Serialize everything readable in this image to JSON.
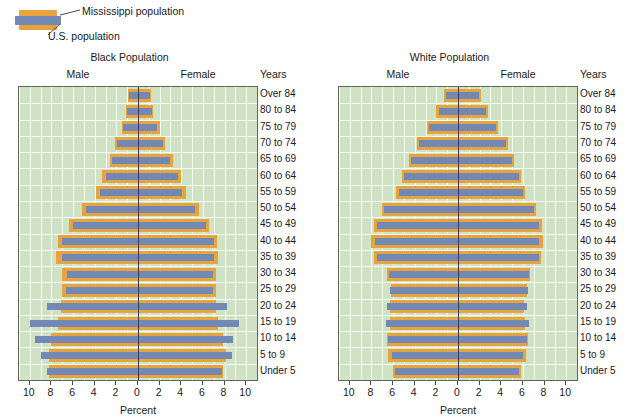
{
  "legend": {
    "items": [
      {
        "label": "Mississippi population",
        "color": "#e8a33d",
        "name": "mississippi"
      },
      {
        "label": "U.S. population",
        "color": "#7289b5",
        "name": "us"
      }
    ]
  },
  "axis": {
    "xlabel": "Percent",
    "years_header": "Years",
    "male_label": "Male",
    "female_label": "Female",
    "ticks": [
      10,
      8,
      6,
      4,
      2,
      0,
      2,
      4,
      6,
      8,
      10
    ],
    "xlim": [
      -11,
      11
    ]
  },
  "colors": {
    "mississippi": "#e8a33d",
    "us": "#7289b5",
    "plot_background": "#cfe3c4",
    "gridline": "#ffffff",
    "center_axis": "#3b3b52",
    "plot_border": "#5c6b58"
  },
  "chart_data": [
    {
      "type": "bar",
      "title": "Black Population",
      "subtype": "population-pyramid",
      "xlabel": "Percent",
      "ylabel": "Years",
      "xlim": [
        -11,
        11
      ],
      "xticks": [
        10,
        8,
        6,
        4,
        2,
        0,
        2,
        4,
        6,
        8,
        10
      ],
      "grid": true,
      "legend_position": "top-left",
      "categories": [
        "Over 84",
        "80 to 84",
        "75 to 79",
        "70 to 74",
        "65 to 69",
        "60 to 64",
        "55 to 59",
        "50 to 54",
        "45 to 49",
        "40 to 44",
        "35 to 39",
        "30 to 34",
        "25 to 29",
        "20 to 24",
        "15 to 19",
        "10 to 14",
        "5 to 9",
        "Under 5"
      ],
      "series": [
        {
          "name": "Mississippi population",
          "color": "#e8a33d",
          "male": [
            0.9,
            1.1,
            1.5,
            2.1,
            2.6,
            3.3,
            3.9,
            5.2,
            6.4,
            7.4,
            7.6,
            7.0,
            7.0,
            7.1,
            7.4,
            8.0,
            8.2,
            8.2
          ],
          "female": [
            1.2,
            1.4,
            2.0,
            2.5,
            3.2,
            4.0,
            4.4,
            5.6,
            6.6,
            7.3,
            7.4,
            7.2,
            7.2,
            7.2,
            7.4,
            7.9,
            8.1,
            7.9
          ]
        },
        {
          "name": "U.S. population",
          "color": "#7289b5",
          "male": [
            0.8,
            1.0,
            1.4,
            1.9,
            2.4,
            3.0,
            3.5,
            4.8,
            6.0,
            7.0,
            7.0,
            6.6,
            6.7,
            8.4,
            10.0,
            9.5,
            9.0,
            8.4
          ],
          "female": [
            1.1,
            1.3,
            1.8,
            2.3,
            3.0,
            3.7,
            4.1,
            5.3,
            6.3,
            7.0,
            7.0,
            6.9,
            6.9,
            8.2,
            9.3,
            8.8,
            8.7,
            7.8
          ]
        }
      ]
    },
    {
      "type": "bar",
      "title": "White Population",
      "subtype": "population-pyramid",
      "xlabel": "Percent",
      "ylabel": "Years",
      "xlim": [
        -11,
        11
      ],
      "xticks": [
        10,
        8,
        6,
        4,
        2,
        0,
        2,
        4,
        6,
        8,
        10
      ],
      "grid": true,
      "legend_position": "top-left",
      "categories": [
        "Over 84",
        "80 to 84",
        "75 to 79",
        "70 to 74",
        "65 to 69",
        "60 to 64",
        "55 to 59",
        "50 to 54",
        "45 to 49",
        "40 to 44",
        "35 to 39",
        "30 to 34",
        "25 to 29",
        "20 to 24",
        "15 to 19",
        "10 to 14",
        "5 to 9",
        "Under 5"
      ],
      "series": [
        {
          "name": "Mississippi population",
          "color": "#e8a33d",
          "male": [
            1.3,
            2.0,
            2.9,
            3.8,
            4.5,
            5.2,
            5.7,
            7.0,
            7.8,
            8.0,
            7.8,
            6.6,
            6.2,
            6.3,
            6.3,
            6.6,
            6.5,
            6.0
          ],
          "female": [
            2.1,
            2.8,
            3.7,
            4.6,
            5.2,
            5.8,
            6.2,
            7.2,
            7.8,
            7.9,
            7.7,
            6.7,
            6.4,
            6.1,
            6.2,
            6.5,
            6.3,
            5.8
          ]
        },
        {
          "name": "U.S. population",
          "color": "#7289b5",
          "male": [
            1.1,
            1.8,
            2.7,
            3.6,
            4.3,
            5.0,
            5.5,
            6.8,
            7.5,
            7.7,
            7.5,
            6.4,
            6.3,
            6.6,
            6.7,
            6.5,
            6.1,
            5.8
          ],
          "female": [
            1.9,
            2.6,
            3.5,
            4.4,
            5.0,
            5.6,
            6.0,
            7.0,
            7.5,
            7.5,
            7.5,
            6.6,
            6.5,
            6.4,
            6.6,
            6.4,
            6.0,
            5.6
          ]
        }
      ]
    }
  ]
}
